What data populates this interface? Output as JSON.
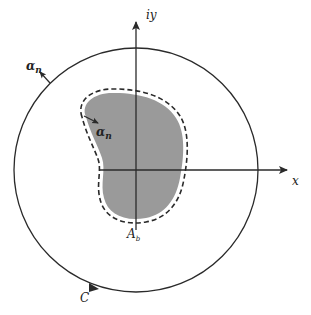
{
  "figure": {
    "type": "complex-plane contour diagram",
    "axes": {
      "horizontal_label": "x",
      "vertical_label": "iy"
    },
    "labels": {
      "outer_normal": "α",
      "outer_normal_sub": "n",
      "inner_normal": "α",
      "inner_normal_sub": "n",
      "region": "A",
      "region_sub": "b",
      "contour": "C"
    },
    "colors": {
      "line": "#2a2a2a",
      "region_fill": "#9a9a9a",
      "background": "#ffffff"
    }
  }
}
